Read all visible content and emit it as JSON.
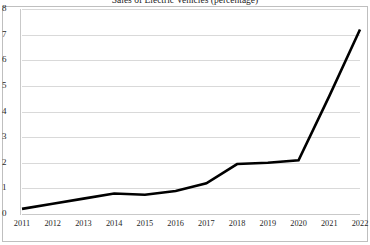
{
  "chart_data": {
    "type": "line",
    "title": "Sales of Electric Vehicles (percentage)",
    "xlabel": "",
    "ylabel": "",
    "categories": [
      "2011",
      "2012",
      "2013",
      "2014",
      "2015",
      "2016",
      "2017",
      "2018",
      "2019",
      "2020",
      "2021",
      "2022"
    ],
    "values": [
      0.2,
      0.4,
      0.6,
      0.8,
      0.75,
      0.9,
      1.2,
      1.95,
      2.0,
      2.1,
      4.6,
      7.2
    ],
    "series": [
      {
        "name": "Sales of Electric Vehicles",
        "values": [
          0.2,
          0.4,
          0.6,
          0.8,
          0.75,
          0.9,
          1.2,
          1.95,
          2.0,
          2.1,
          4.6,
          7.2
        ]
      }
    ],
    "ylim": [
      0,
      8
    ],
    "y_ticks": [
      0,
      1,
      2,
      3,
      4,
      5,
      6,
      7,
      8
    ],
    "y_tick_labels": [
      "0",
      "1",
      "2",
      "3",
      "4",
      "5",
      "6",
      "7",
      "8"
    ],
    "grid": true,
    "grid_axis": "y",
    "legend": false,
    "legend_position": "none",
    "markers": false,
    "line_color": "#000000",
    "line_width": 2.6,
    "grid_color": "#d9d9d9",
    "background_color": "#ffffff",
    "border_color": "#bfbfbf"
  }
}
